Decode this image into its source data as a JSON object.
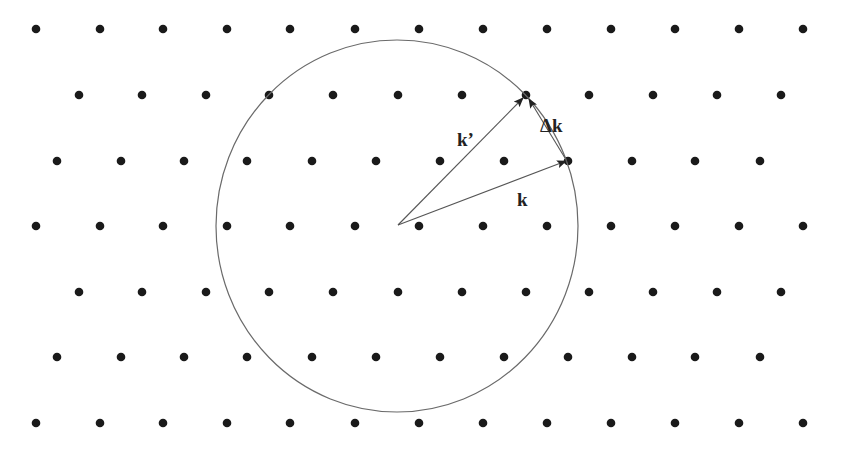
{
  "colors": {
    "background": "#ffffff",
    "dot": "#1a1a1a",
    "circle": "#6a6a6a",
    "vector": "#555555",
    "label": "#222222"
  },
  "lattice": {
    "rows": [
      {
        "y": 29,
        "xs": [
          36,
          100,
          163,
          227,
          290,
          355,
          419,
          483,
          547,
          611,
          675,
          739,
          803
        ]
      },
      {
        "y": 95,
        "xs": [
          79,
          142,
          206,
          269,
          333,
          398,
          462,
          526,
          589,
          653,
          717,
          781
        ]
      },
      {
        "y": 161,
        "xs": [
          57,
          121,
          184,
          247,
          312,
          376,
          440,
          504,
          568,
          632,
          695,
          760
        ]
      },
      {
        "y": 226,
        "xs": [
          36,
          100,
          163,
          227,
          290,
          355,
          419,
          483,
          547,
          611,
          675,
          739,
          803
        ]
      },
      {
        "y": 292,
        "xs": [
          79,
          142,
          206,
          269,
          333,
          398,
          462,
          526,
          589,
          653,
          717,
          781
        ]
      },
      {
        "y": 357,
        "xs": [
          57,
          121,
          184,
          247,
          312,
          376,
          440,
          504,
          568,
          632,
          695,
          760
        ]
      },
      {
        "y": 423,
        "xs": [
          36,
          100,
          163,
          227,
          290,
          355,
          419,
          483,
          547,
          611,
          675,
          739,
          803
        ]
      }
    ],
    "dot_radius": 4.3
  },
  "circle": {
    "cx": 397,
    "cy": 226,
    "rx": 181,
    "ry": 186
  },
  "vectors": {
    "origin": {
      "x": 398,
      "y": 225
    },
    "k": {
      "label": "k",
      "tip": {
        "x": 566,
        "y": 161
      },
      "label_pos": {
        "x": 517,
        "y": 206
      }
    },
    "k_prime": {
      "label": "k’",
      "tip": {
        "x": 523,
        "y": 98
      },
      "label_pos": {
        "x": 457,
        "y": 146
      }
    },
    "delta_k": {
      "label": "Δk",
      "from": {
        "x": 565,
        "y": 158
      },
      "to": {
        "x": 529,
        "y": 99
      },
      "label_pos": {
        "x": 540,
        "y": 132
      }
    }
  }
}
